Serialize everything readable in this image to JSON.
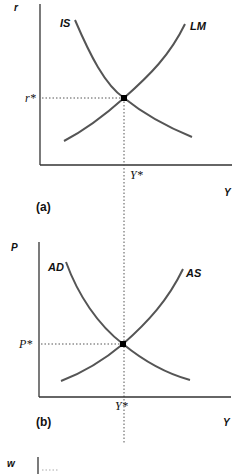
{
  "panel_a": {
    "label": "(a)",
    "y_axis_label": "r",
    "x_axis_label": "Y",
    "equilibrium_y_label": "r*",
    "equilibrium_x_label": "Y*",
    "curve_1_label": "IS",
    "curve_2_label": "LM"
  },
  "panel_b": {
    "label": "(b)",
    "y_axis_label": "P",
    "x_axis_label": "Y",
    "equilibrium_y_label": "P*",
    "equilibrium_x_label": "Y*",
    "curve_1_label": "AD",
    "curve_2_label": "AS"
  },
  "panel_c": {
    "y_axis_label": "w",
    "partial_label": "W/P"
  },
  "colors": {
    "curve": "#555555",
    "axis": "#333333",
    "point": "#000000"
  }
}
